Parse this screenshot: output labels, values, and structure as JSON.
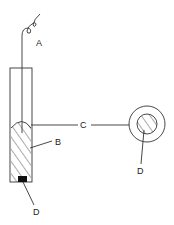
{
  "diagram": {
    "colors": {
      "stroke": "#333333",
      "fill_dark": "#111111",
      "background": "#ffffff"
    },
    "labels": {
      "A": "A",
      "B": "B",
      "C": "C",
      "D_side": "D",
      "D_section": "D"
    },
    "parts": [
      {
        "id": "A",
        "description": "coiled wire lead"
      },
      {
        "id": "B",
        "description": "hatched filling inside tube"
      },
      {
        "id": "C",
        "description": "cross-section reference line"
      },
      {
        "id": "D",
        "description": "dark core element"
      }
    ]
  }
}
